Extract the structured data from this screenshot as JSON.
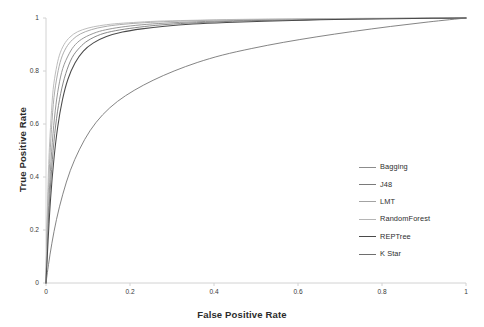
{
  "chart_data": {
    "type": "line",
    "title": "",
    "xlabel": "False Positive Rate",
    "ylabel": "True Positive Rate",
    "xlim": [
      0,
      1
    ],
    "ylim": [
      0,
      1
    ],
    "xticks": [
      "0",
      "0.2",
      "0.4",
      "0.6",
      "0.8",
      "1"
    ],
    "yticks": [
      "0",
      "0.2",
      "0.4",
      "0.6",
      "0.8",
      "1"
    ],
    "xtick_values": [
      0,
      0.2,
      0.4,
      0.6,
      0.8,
      1
    ],
    "ytick_values": [
      0,
      0.2,
      0.4,
      0.6,
      0.8,
      1
    ],
    "grid": false,
    "legend_position": "center-right",
    "series": [
      {
        "name": "Bagging",
        "color": "#8c8c8c",
        "width": 0.9,
        "x": [
          0,
          0.004,
          0.009,
          0.015,
          0.022,
          0.03,
          0.04,
          0.055,
          0.07,
          0.09,
          0.12,
          0.15,
          0.19,
          0.24,
          0.3,
          0.38,
          0.47,
          0.57,
          0.68,
          0.8,
          0.9,
          1
        ],
        "y": [
          0,
          0.2,
          0.38,
          0.53,
          0.65,
          0.74,
          0.81,
          0.865,
          0.9,
          0.925,
          0.946,
          0.958,
          0.968,
          0.976,
          0.982,
          0.987,
          0.991,
          0.994,
          0.996,
          0.998,
          0.999,
          1
        ]
      },
      {
        "name": "J48",
        "color": "#7a7a7a",
        "width": 0.9,
        "x": [
          0,
          0.004,
          0.01,
          0.017,
          0.025,
          0.035,
          0.047,
          0.062,
          0.08,
          0.1,
          0.13,
          0.165,
          0.21,
          0.26,
          0.32,
          0.4,
          0.49,
          0.59,
          0.7,
          0.81,
          0.91,
          1
        ],
        "y": [
          0,
          0.18,
          0.35,
          0.5,
          0.62,
          0.715,
          0.79,
          0.85,
          0.888,
          0.915,
          0.938,
          0.952,
          0.963,
          0.972,
          0.979,
          0.985,
          0.99,
          0.993,
          0.996,
          0.998,
          0.999,
          1
        ]
      },
      {
        "name": "LMT",
        "color": "#a3a3a3",
        "width": 0.9,
        "x": [
          0,
          0.003,
          0.008,
          0.013,
          0.019,
          0.027,
          0.036,
          0.048,
          0.063,
          0.082,
          0.108,
          0.138,
          0.175,
          0.222,
          0.28,
          0.355,
          0.445,
          0.545,
          0.66,
          0.78,
          0.89,
          1
        ],
        "y": [
          0,
          0.23,
          0.43,
          0.58,
          0.7,
          0.785,
          0.845,
          0.888,
          0.918,
          0.94,
          0.956,
          0.967,
          0.975,
          0.981,
          0.986,
          0.99,
          0.993,
          0.995,
          0.997,
          0.998,
          0.999,
          1
        ]
      },
      {
        "name": "RandomForest",
        "color": "#b5b5b5",
        "width": 0.9,
        "x": [
          0,
          0.003,
          0.007,
          0.012,
          0.017,
          0.024,
          0.032,
          0.043,
          0.057,
          0.075,
          0.1,
          0.128,
          0.163,
          0.208,
          0.265,
          0.34,
          0.43,
          0.53,
          0.645,
          0.77,
          0.885,
          1
        ],
        "y": [
          0,
          0.26,
          0.47,
          0.62,
          0.73,
          0.805,
          0.86,
          0.9,
          0.928,
          0.948,
          0.962,
          0.971,
          0.978,
          0.983,
          0.988,
          0.991,
          0.994,
          0.996,
          0.997,
          0.999,
          0.999,
          1
        ]
      },
      {
        "name": "REPTree",
        "color": "#4a4a4a",
        "width": 1.05,
        "x": [
          0,
          0.005,
          0.011,
          0.019,
          0.028,
          0.039,
          0.052,
          0.069,
          0.089,
          0.113,
          0.144,
          0.182,
          0.228,
          0.283,
          0.35,
          0.43,
          0.52,
          0.62,
          0.72,
          0.83,
          0.92,
          1
        ],
        "y": [
          0,
          0.16,
          0.32,
          0.47,
          0.59,
          0.69,
          0.768,
          0.83,
          0.875,
          0.906,
          0.93,
          0.947,
          0.959,
          0.969,
          0.977,
          0.983,
          0.988,
          0.992,
          0.995,
          0.997,
          0.999,
          1
        ]
      },
      {
        "name": "K Star",
        "color": "#6e6e6e",
        "width": 0.85,
        "x": [
          0,
          0.006,
          0.014,
          0.025,
          0.04,
          0.058,
          0.08,
          0.105,
          0.135,
          0.17,
          0.21,
          0.255,
          0.305,
          0.36,
          0.42,
          0.49,
          0.565,
          0.645,
          0.73,
          0.82,
          0.91,
          1
        ],
        "y": [
          0,
          0.07,
          0.15,
          0.24,
          0.335,
          0.425,
          0.505,
          0.575,
          0.635,
          0.685,
          0.727,
          0.765,
          0.8,
          0.832,
          0.86,
          0.885,
          0.908,
          0.929,
          0.949,
          0.968,
          0.985,
          1
        ]
      }
    ]
  },
  "axes": {
    "axis_line_color": "#d0d0d0",
    "tick_text_color": "#3a3a3a"
  }
}
